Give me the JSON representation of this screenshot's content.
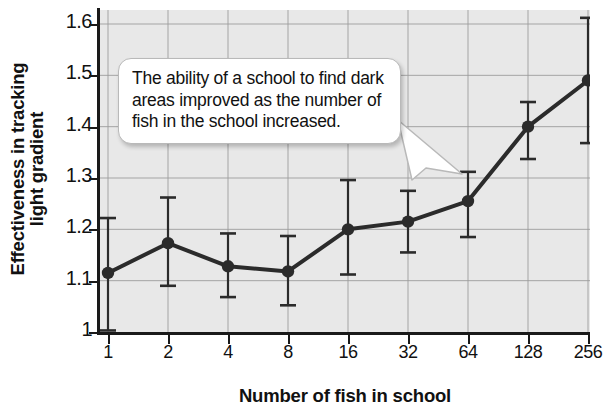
{
  "chart_data": {
    "type": "line",
    "title": "",
    "xlabel": "Number of fish in school",
    "ylabel": "Effectiveness in tracking light gradient",
    "ylabel_line1": "Effectiveness in tracking",
    "ylabel_line2": "light gradient",
    "categories": [
      1,
      2,
      4,
      8,
      16,
      32,
      64,
      128,
      256
    ],
    "xtick_labels": [
      "1",
      "2",
      "4",
      "8",
      "16",
      "32",
      "64",
      "128",
      "256"
    ],
    "ytick_labels": [
      "1.6",
      "1.5",
      "1.4",
      "1.3",
      "1.2",
      "1.1",
      "1"
    ],
    "ytick_values": [
      1.6,
      1.5,
      1.4,
      1.3,
      1.2,
      1.1,
      1.0
    ],
    "ylim": [
      1.0,
      1.62
    ],
    "xscale": "log2",
    "grid": true,
    "legend": null,
    "series": [
      {
        "name": "Effectiveness in tracking light gradient",
        "values": [
          1.115,
          1.173,
          1.128,
          1.118,
          1.2,
          1.215,
          1.255,
          1.4,
          1.49
        ],
        "error_low": [
          1.003,
          1.09,
          1.068,
          1.052,
          1.112,
          1.155,
          1.185,
          1.337,
          1.368
        ],
        "error_high": [
          1.222,
          1.262,
          1.192,
          1.187,
          1.296,
          1.275,
          1.312,
          1.448,
          1.612
        ],
        "color": "#2b2b2b",
        "marker": "circle",
        "linewidth": 4
      }
    ],
    "annotations": [
      {
        "name": "callout",
        "text": "The ability of a school to find dark areas improved as the number of fish in the school increased.",
        "points_to_category": 64
      }
    ],
    "colors": {
      "plot_background": "#e8e8e8",
      "axis": "#1a1a1a",
      "gridline": "#9a9a9a",
      "data": "#2b2b2b",
      "callout_background": "#ffffff",
      "callout_border": "#b9b9b9",
      "page_background": "#ffffff"
    }
  }
}
